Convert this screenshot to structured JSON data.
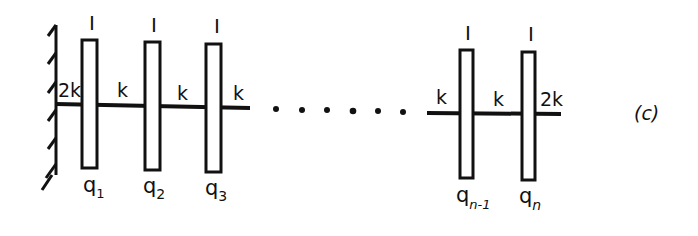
{
  "diagram": {
    "tag": "(c)",
    "wall": {
      "type": "fixed-wall"
    },
    "disks": [
      {
        "id": "disk-1",
        "inertia_label": "I",
        "coord_label": "q",
        "coord_sub": "1"
      },
      {
        "id": "disk-2",
        "inertia_label": "I",
        "coord_label": "q",
        "coord_sub": "2"
      },
      {
        "id": "disk-3",
        "inertia_label": "I",
        "coord_label": "q",
        "coord_sub": "3"
      },
      {
        "id": "disk-n-1",
        "inertia_label": "I",
        "coord_label": "q",
        "coord_sub": "n-1"
      },
      {
        "id": "disk-n",
        "inertia_label": "I",
        "coord_label": "q",
        "coord_sub": "n"
      }
    ],
    "springs": [
      {
        "id": "spring-wall-1",
        "label": "2k"
      },
      {
        "id": "spring-1-2",
        "label": "k"
      },
      {
        "id": "spring-2-3",
        "label": "k"
      },
      {
        "id": "spring-3-next",
        "label": "k"
      },
      {
        "id": "spring-prev-n-1",
        "label": "k"
      },
      {
        "id": "spring-n-1-n",
        "label": "k"
      },
      {
        "id": "spring-n-end",
        "label": "2k"
      }
    ],
    "ellipsis": "• • • • • •"
  }
}
